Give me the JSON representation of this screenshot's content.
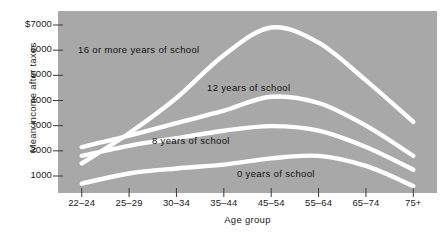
{
  "figure": {
    "background_color": "#ffffff",
    "plot_background_color": "#a8a8a8",
    "curve_color": "#ffffff",
    "text_color": "#1a1a1a"
  },
  "chart_data": {
    "type": "line",
    "title": "",
    "xlabel": "Age group",
    "ylabel": "Mean income after taxes",
    "categories": [
      "22–24",
      "25–29",
      "30–34",
      "35–44",
      "45–54",
      "55–64",
      "65–74",
      "75+"
    ],
    "ytick_labels": [
      "$7000",
      "6000",
      "5000",
      "4000",
      "3000",
      "2000",
      "1000"
    ],
    "ytick_values": [
      7000,
      6000,
      5000,
      4000,
      3000,
      2000,
      1000
    ],
    "ylim": [
      0,
      7400
    ],
    "grid": false,
    "legend_position": "inline-annotations",
    "series": [
      {
        "name": "16 or more years of school",
        "label": "16 or more years of school",
        "values": [
          1500,
          2700,
          4100,
          5800,
          6900,
          6300,
          4800,
          3150
        ]
      },
      {
        "name": "12 years of school",
        "label": "12 years of school",
        "values": [
          2150,
          2600,
          3100,
          3600,
          4150,
          3900,
          3000,
          1800
        ]
      },
      {
        "name": "8 years of school",
        "label": "8 years of school",
        "values": [
          1800,
          2200,
          2500,
          2800,
          2980,
          2800,
          2150,
          1250
        ]
      },
      {
        "name": "0 years of school",
        "label": "0 years of school",
        "values": [
          700,
          1100,
          1300,
          1450,
          1700,
          1800,
          1400,
          600
        ]
      }
    ]
  },
  "annotations": [
    {
      "text": "16 or more years of school",
      "x": 78,
      "y": 44
    },
    {
      "text": "12 years of school",
      "x": 207,
      "y": 82
    },
    {
      "text": "8 years of school",
      "x": 152,
      "y": 135
    },
    {
      "text": "0 years of school",
      "x": 237,
      "y": 168
    }
  ]
}
